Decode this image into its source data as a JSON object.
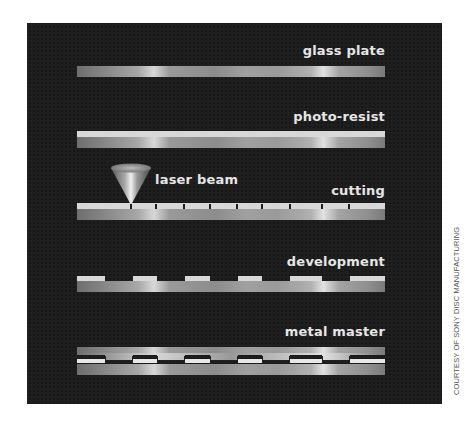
{
  "diagram": {
    "background_color": "#1e1e1e",
    "steps": [
      {
        "id": "glass-plate",
        "label": "glass plate"
      },
      {
        "id": "photo-resist",
        "label": "photo-resist"
      },
      {
        "id": "cutting",
        "label": "cutting"
      },
      {
        "id": "development",
        "label": "development"
      },
      {
        "id": "metal-master",
        "label": "metal master"
      }
    ],
    "annotations": {
      "laser": "laser beam"
    },
    "credit": "COURTESY OF SONY DISC MANUFACTURING"
  }
}
